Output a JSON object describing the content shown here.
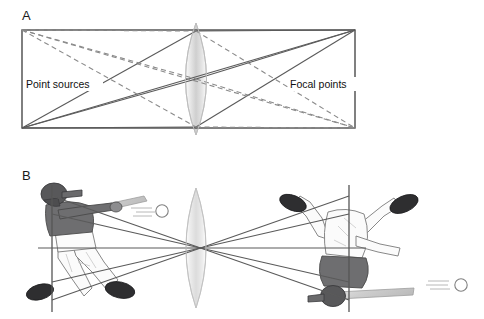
{
  "figure": {
    "title_panel_a": "A",
    "title_panel_b": "B",
    "labels": {
      "point_sources": "Point sources",
      "focal_points": "Focal points"
    }
  },
  "panel_a": {
    "letter": "A",
    "frame": {
      "x": 22,
      "y": 30,
      "width": 333,
      "height": 98
    },
    "lens": {
      "cx": 196,
      "cy": 79,
      "rx": 21,
      "ry": 56
    },
    "point_sources_label": "Point sources",
    "focal_points_label": "Focal points",
    "solid_ray_color": "#5a5a5a",
    "dashed_ray_color": "#8a8a8a",
    "frame_color": "#4a4a4a",
    "lens_fill_light": "#f4f4f4",
    "lens_fill_mid": "#c9c9c9"
  },
  "panel_b": {
    "letter": "B",
    "lens": {
      "cx": 196,
      "cy": 248,
      "rx": 20,
      "ry": 60
    },
    "left_object_plane_x": 52,
    "right_image_plane_x": 349,
    "ray_color": "#5a5a5a",
    "figure_left": {
      "name": "upright-batter",
      "helmet_color": "#58585a",
      "jersey_color": "#6e6e70",
      "pants_color": "#fbfbfb",
      "shoe_color": "#2e2e30",
      "bat_color": "#cfcfcf",
      "ball_color": "#ffffff"
    },
    "figure_right": {
      "name": "inverted-batter",
      "helmet_color": "#58585a",
      "jersey_color": "#fbfbfb",
      "pants_color": "#6e6e70",
      "shoe_color": "#2e2e30",
      "bat_color": "#cfcfcf",
      "ball_color": "#ffffff"
    }
  }
}
